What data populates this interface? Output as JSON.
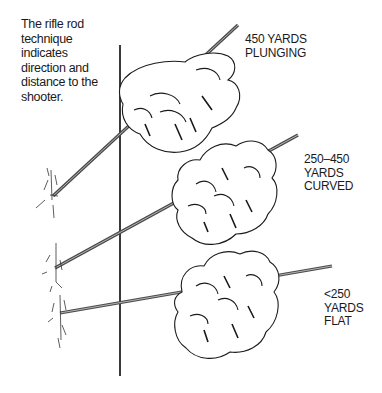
{
  "caption": "The rifle rod\ntechnique\nindicates\ndirection and\ndistance to the\nshooter.",
  "labels": [
    {
      "id": "plunging",
      "text": "450 YARDS\nPLUNGING",
      "range": "450 yards",
      "trajectory": "plunging"
    },
    {
      "id": "curved",
      "text": "250–450\nYARDS\nCURVED",
      "range": "250–450 yards",
      "trajectory": "curved"
    },
    {
      "id": "flat",
      "text": "<250\nYARDS\nFLAT",
      "range": "<250 yards",
      "trajectory": "flat"
    }
  ],
  "illustration": {
    "elements": [
      "vertical-pole",
      "rod-plunging",
      "rod-curved",
      "rod-flat",
      "hand-top",
      "hand-middle",
      "hand-bottom",
      "bullet-hole-top",
      "bullet-hole-middle",
      "bullet-hole-bottom"
    ],
    "colors": {
      "ink": "#1a1a1a",
      "rod": "#555555",
      "background": "#ffffff"
    }
  }
}
